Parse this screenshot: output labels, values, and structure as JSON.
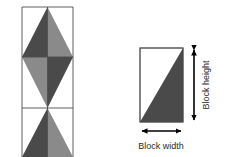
{
  "figure": {
    "background_color": "#ffffff",
    "outline_color": "#4d4d4d",
    "palette": {
      "dark_gray": "#4a4a4a",
      "mid_gray": "#7a7a7a",
      "light_gray": "#9a9a9a",
      "white": "#ffffff",
      "line": "#4d4d4d",
      "arrow": "#000000",
      "text": "#2b2b2b"
    }
  },
  "pattern": {
    "name": "tessellated-block-pattern",
    "grid": {
      "columns": 2,
      "rows": 3,
      "x": 22,
      "y": 7,
      "cell_width": 25.5,
      "cell_height": 50,
      "total_width": 51,
      "total_height": 150
    },
    "cells": [
      {
        "row": 0,
        "col": 0,
        "fill": "#4a4a4a",
        "triangle": "bottom-left-top-right-right-filled",
        "points": "22,57 47.5,57 47.5,7"
      },
      {
        "row": 0,
        "col": 1,
        "fill": "#8a8a8a",
        "triangle": "bottom-right-top-left-left-filled",
        "points": "73,57 47.5,57 47.5,7"
      },
      {
        "row": 1,
        "col": 0,
        "fill": "#8a8a8a",
        "triangle": "top-left-bottom-right-filled",
        "points": "22,57 47.5,57 47.5,108"
      },
      {
        "row": 1,
        "col": 1,
        "fill": "#4a4a4a",
        "triangle": "top-right-bottom-left-filled",
        "points": "73,57 47.5,57 47.5,108"
      },
      {
        "row": 2,
        "col": 0,
        "fill": "#4a4a4a",
        "triangle": "bottom-left-top-right-right-filled",
        "points": "22,157 47.5,157 47.5,108"
      },
      {
        "row": 2,
        "col": 1,
        "fill": "#8a8a8a",
        "triangle": "bottom-right-top-left-left-filled",
        "points": "73,157 47.5,157 47.5,108"
      }
    ]
  },
  "unit_block": {
    "name": "single-block",
    "rect": {
      "x": 140,
      "y": 48,
      "width": 43,
      "height": 74
    },
    "fill_triangle": {
      "fill": "#4a4a4a",
      "description": "lower-right triangle filled, diagonal from bottom-left to top-right",
      "points": "140,122 183,122 183,48"
    },
    "unfilled_region": {
      "fill": "#ffffff",
      "description": "upper-left triangle unfilled"
    }
  },
  "annotations": {
    "height_label": "Block height",
    "width_label": "Block width",
    "height_arrow": {
      "orientation": "vertical",
      "double_headed": true,
      "x": 194,
      "y_top": 48,
      "y_bottom": 122
    },
    "width_arrow": {
      "orientation": "horizontal",
      "double_headed": true,
      "y": 131,
      "x_left": 140,
      "x_right": 183
    }
  }
}
